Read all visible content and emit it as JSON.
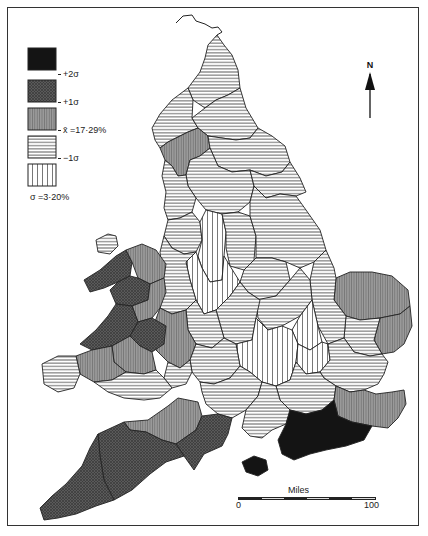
{
  "legend": {
    "classes": [
      {
        "id": "above_2sd",
        "fill": "pat-black",
        "tick": ""
      },
      {
        "id": "1_to_2sd",
        "fill": "pat-cross",
        "tick": "+2σ"
      },
      {
        "id": "mean_to_1sd",
        "fill": "pat-vgrey",
        "tick": "+1σ"
      },
      {
        "id": "minus1sd_to_mean",
        "fill": "pat-hline",
        "tick": "x̄ =17·29%"
      },
      {
        "id": "below_minus1sd",
        "fill": "pat-vline",
        "tick": "−1σ"
      }
    ],
    "ticks": [
      "+2σ",
      "+1σ",
      "x̄ =17·29%",
      "−1σ"
    ],
    "sigma_label": "σ =3·20%"
  },
  "north_arrow": {
    "label": "N"
  },
  "scale_bar": {
    "title": "Miles",
    "start": "0",
    "end": "100"
  },
  "map": {
    "region": "England and Wales",
    "mean_percent": 17.29,
    "sigma_percent": 3.2,
    "colors": {
      "black": "#1a1a1a",
      "cross": "#4a4a4a",
      "vgrey": "#8a8a8a",
      "line": "#333333",
      "paper": "#ffffff"
    }
  }
}
